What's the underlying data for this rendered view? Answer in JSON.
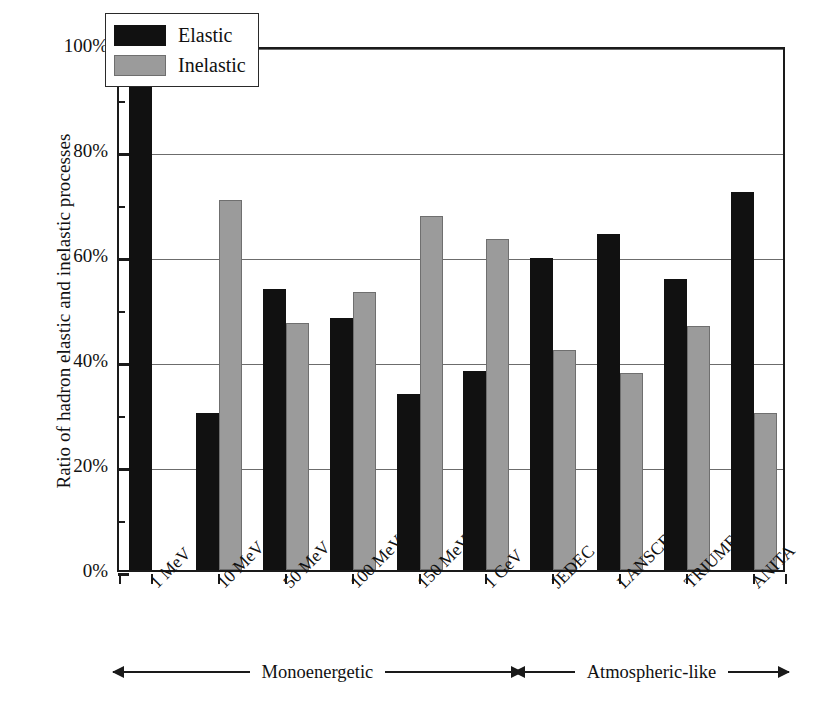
{
  "chart_data": {
    "type": "bar",
    "title": "",
    "xlabel": "",
    "ylabel": "Ratio of hadron elastic and inelastic processes",
    "ylim": [
      0,
      100
    ],
    "yunit": "%",
    "grid": true,
    "legend_position": "top-left",
    "categories": [
      "1 MeV",
      "10 MeV",
      "50 MeV",
      "100 MeV",
      "150 MeV",
      "1 GeV",
      "JEDEC",
      "LANSCE",
      "TRIUMF",
      "ANITA"
    ],
    "series": [
      {
        "name": "Elastic",
        "color": "#111111",
        "values": [
          100,
          30,
          53.5,
          48,
          33.5,
          38,
          59.5,
          64,
          55.5,
          72
        ]
      },
      {
        "name": "Inelastic",
        "color": "#9b9b9b",
        "values": [
          0,
          70.5,
          47,
          53,
          67.5,
          63,
          42,
          37.5,
          46.5,
          30
        ]
      }
    ],
    "ytick_labels": [
      "0%",
      "20%",
      "40%",
      "60%",
      "80%",
      "100%"
    ],
    "ytick_values": [
      0,
      20,
      40,
      60,
      80,
      100
    ],
    "yminor_values": [
      10,
      30,
      50,
      70,
      90
    ],
    "annotations": [
      {
        "label": "Monoenergetic",
        "from_category": "1 MeV",
        "to_category": "1 GeV",
        "style": "double-arrow"
      },
      {
        "label": "Atmospheric-like",
        "from_category": "JEDEC",
        "to_category": "ANITA",
        "style": "double-arrow"
      }
    ]
  },
  "legend": {
    "items": [
      {
        "label": "Elastic",
        "swatch": "black-square-icon"
      },
      {
        "label": "Inelastic",
        "swatch": "gray-square-icon"
      }
    ]
  },
  "axis": {
    "y_title": "Ratio of hadron elastic and inelastic processes"
  }
}
